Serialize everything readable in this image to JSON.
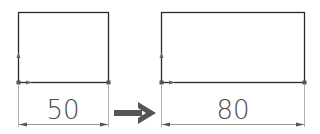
{
  "diagram": {
    "left_sketch": {
      "dimension_value": "50"
    },
    "right_sketch": {
      "dimension_value": "80"
    },
    "transition_arrow": "right-arrow",
    "colors": {
      "line": "#2a2a2a",
      "extension": "#b0b0b0",
      "arrow": "#555555",
      "text": "#4a4a4a"
    }
  }
}
